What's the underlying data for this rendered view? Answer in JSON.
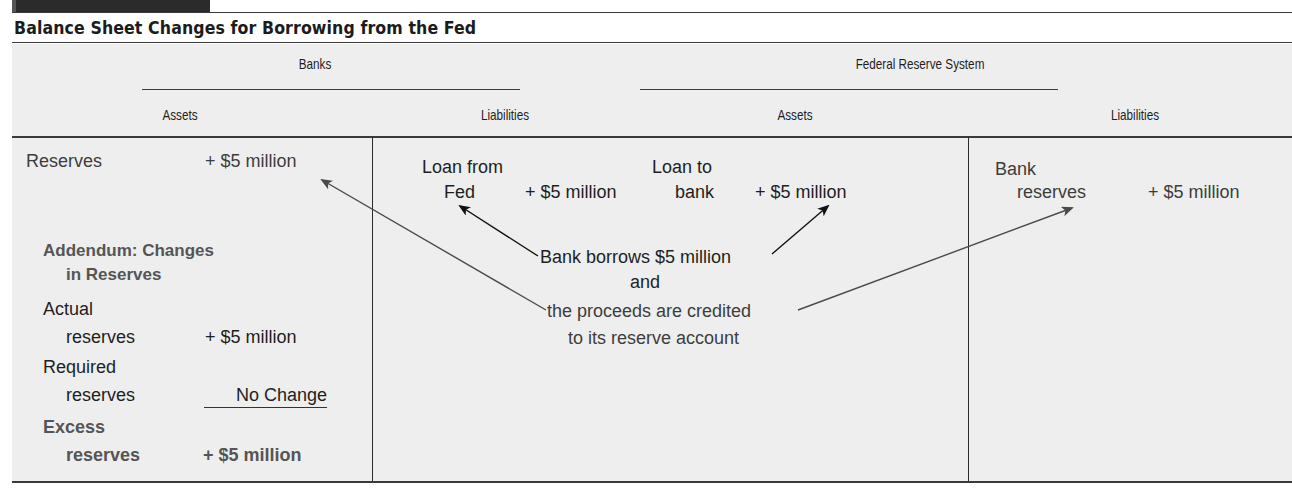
{
  "title": "Balance Sheet Changes for Borrowing from the Fed",
  "groups": {
    "banks": "Banks",
    "fed": "Federal Reserve System"
  },
  "columns": {
    "banks_assets": "Assets",
    "banks_liabilities": "Liabilities",
    "fed_assets": "Assets",
    "fed_liabilities": "Liabilities"
  },
  "banks_assets": {
    "reserves_label": "Reserves",
    "reserves_value": "+ $5 million",
    "addendum_line1": "Addendum: Changes",
    "addendum_line2": "in Reserves",
    "actual_line1": "Actual",
    "actual_line2": "reserves",
    "actual_value": "+ $5 million",
    "required_line1": "Required",
    "required_line2": "reserves",
    "required_value": "No Change",
    "excess_line1": "Excess",
    "excess_line2": "reserves",
    "excess_value": "+ $5 million"
  },
  "banks_liabilities": {
    "label_line1": "Loan from",
    "label_line2": "Fed",
    "value": "+ $5 million"
  },
  "fed_assets": {
    "label_line1": "Loan to",
    "label_line2": "bank",
    "value": "+ $5 million"
  },
  "fed_liabilities": {
    "label_line1": "Bank",
    "label_line2": "reserves",
    "value": "+ $5 million"
  },
  "annotation": {
    "line1": "Bank borrows $5 million",
    "line2": "and",
    "line3": "the proceeds are credited",
    "line4": "to its reserve account"
  },
  "colors": {
    "panel_bg": "#eeeeee",
    "rule": "#3a3a3a",
    "text_dark": "#1e1e1e",
    "text_gray": "#3d3d3d",
    "arrow_dark": "#111111",
    "arrow_gray": "#4a4a4a"
  }
}
